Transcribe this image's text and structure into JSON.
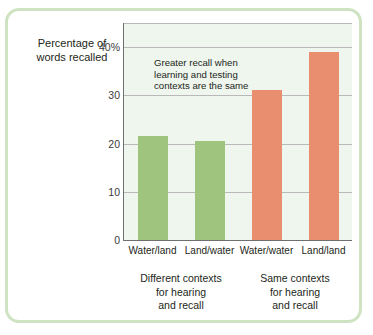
{
  "chart_data": {
    "type": "bar",
    "title": "",
    "subtitle": "",
    "xlabel": "",
    "ylabel": "Percentage of words recalled",
    "ylabel_lines": [
      "Percentage of",
      "words recalled"
    ],
    "categories": [
      "Water/land",
      "Land/water",
      "Water/water",
      "Land/land"
    ],
    "values": [
      21.8,
      20.8,
      31.4,
      39.3
    ],
    "bar_colors": [
      "#9ec47e",
      "#9ec47e",
      "#e98f6f",
      "#e98f6f"
    ],
    "ylim": [
      0,
      45
    ],
    "yticks": [
      0,
      10,
      20,
      30,
      40
    ],
    "ytick_labels": [
      "0",
      "10",
      "20",
      "30",
      "40%"
    ],
    "grid": true,
    "grid_axis": "y",
    "legend": "none",
    "annotations": [
      {
        "text": "Greater recall when learning and testing contexts are the same",
        "lines": [
          "Greater recall when",
          "learning and testing",
          "contexts are the same"
        ]
      }
    ],
    "group_labels": [
      {
        "lines": [
          "Different contexts",
          "for hearing",
          "and recall"
        ],
        "categories": [
          "Water/land",
          "Land/water"
        ]
      },
      {
        "lines": [
          "Same contexts",
          "for hearing",
          "and recall"
        ],
        "categories": [
          "Water/water",
          "Land/land"
        ]
      }
    ],
    "colors": {
      "plot_background": "#eef6ee",
      "frame_border": "#cfe3c2",
      "gridline": "#b9b9b9",
      "axis": "#6f6f6f",
      "green": "#9ec47e",
      "orange": "#e98f6f",
      "text": "#231f20"
    }
  }
}
